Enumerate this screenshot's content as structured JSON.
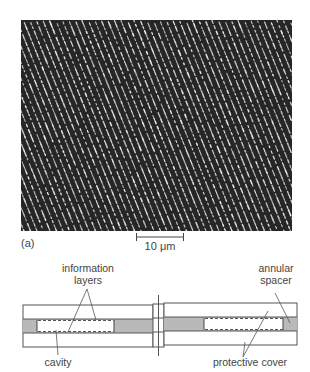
{
  "figure": {
    "panel_label": "(a)",
    "scale_bar": {
      "label": "10 μm",
      "length_label_value": 10,
      "unit": "μm"
    },
    "micrograph": {
      "description": "Micrograph of diagonal tracks of pits (dotted bright lines on dark background)",
      "background_color": "#262626",
      "dot_color": "#d8d8d8",
      "track_spacing_px": 6.5,
      "track_angle_deg": 68
    },
    "diagram": {
      "labels": {
        "information_layers": [
          "information",
          "layers"
        ],
        "annular_spacer": [
          "annular",
          "spacer"
        ],
        "cavity": "cavity",
        "protective_cover": "protective cover"
      },
      "colors": {
        "outline": "#555555",
        "spacer_fill": "#b9b9b9",
        "cavity_fill": "#ffffff"
      }
    }
  }
}
